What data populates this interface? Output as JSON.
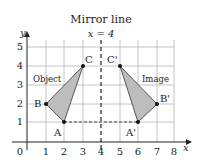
{
  "title_line1": "Mirror line",
  "title_line2": "x = 4",
  "axes": {
    "x_label": "x",
    "y_label": "y",
    "x_ticks": [
      "0",
      "1",
      "2",
      "3",
      "4",
      "5",
      "6",
      "7",
      "8"
    ],
    "y_ticks": [
      "1",
      "2",
      "3",
      "4",
      "5"
    ]
  },
  "object": {
    "label": "Object",
    "points": [
      {
        "name": "A",
        "x": 2,
        "y": 1
      },
      {
        "name": "B",
        "x": 1,
        "y": 2
      },
      {
        "name": "C",
        "x": 3,
        "y": 4
      }
    ]
  },
  "image": {
    "label": "Image",
    "points": [
      {
        "name": "A'",
        "x": 6,
        "y": 1
      },
      {
        "name": "B'",
        "x": 7,
        "y": 2
      },
      {
        "name": "C'",
        "x": 5,
        "y": 4
      }
    ]
  },
  "mirror_line_x": 4,
  "colors": {
    "fill": "#bdbdbd",
    "grid": "#b5b5b5",
    "ink": "#222222"
  }
}
